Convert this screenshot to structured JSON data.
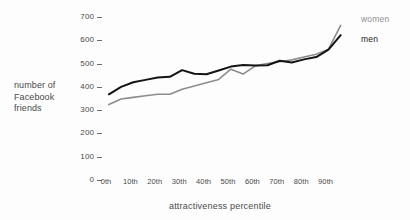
{
  "chart_data": {
    "type": "line",
    "title": "",
    "xlabel": "attractiveness percentile",
    "ylabel": "number of Facebook friends",
    "ylabel_lines": [
      "number of",
      "Facebook",
      "friends"
    ],
    "categories": [
      "0th",
      "10th",
      "20th",
      "30th",
      "40th",
      "50th",
      "60th",
      "70th",
      "80th",
      "90th"
    ],
    "x_tick_labels": [
      "0th",
      "10th",
      "20th",
      "30th",
      "40th",
      "50th",
      "60th",
      "70th",
      "80th",
      "90th"
    ],
    "y_tick_labels": [
      "700",
      "600",
      "500",
      "400",
      "300",
      "200",
      "100",
      "0"
    ],
    "y_ticks": [
      700,
      600,
      500,
      400,
      300,
      200,
      100,
      0
    ],
    "ylim": [
      0,
      700
    ],
    "xlim": [
      0,
      100
    ],
    "grid": false,
    "legend_position": "right",
    "series": [
      {
        "name": "men",
        "color": "#141414",
        "x": [
          2,
          7,
          12,
          17,
          22,
          27,
          32,
          37,
          42,
          47,
          52,
          57,
          62,
          67,
          72,
          77,
          82,
          87,
          92,
          97
        ],
        "values": [
          368,
          400,
          420,
          430,
          440,
          443,
          472,
          456,
          454,
          470,
          487,
          494,
          492,
          493,
          512,
          505,
          518,
          528,
          560,
          622
        ]
      },
      {
        "name": "women",
        "color": "#8c8c8c",
        "x": [
          2,
          7,
          12,
          17,
          22,
          27,
          32,
          37,
          42,
          47,
          52,
          57,
          62,
          67,
          72,
          77,
          82,
          87,
          92,
          97
        ],
        "values": [
          324,
          348,
          355,
          362,
          368,
          368,
          390,
          404,
          418,
          432,
          476,
          455,
          490,
          500,
          508,
          516,
          528,
          540,
          562,
          664
        ]
      }
    ],
    "legend": [
      {
        "label": "women",
        "color": "#8c8c8c"
      },
      {
        "label": "men",
        "color": "#141414"
      }
    ]
  }
}
